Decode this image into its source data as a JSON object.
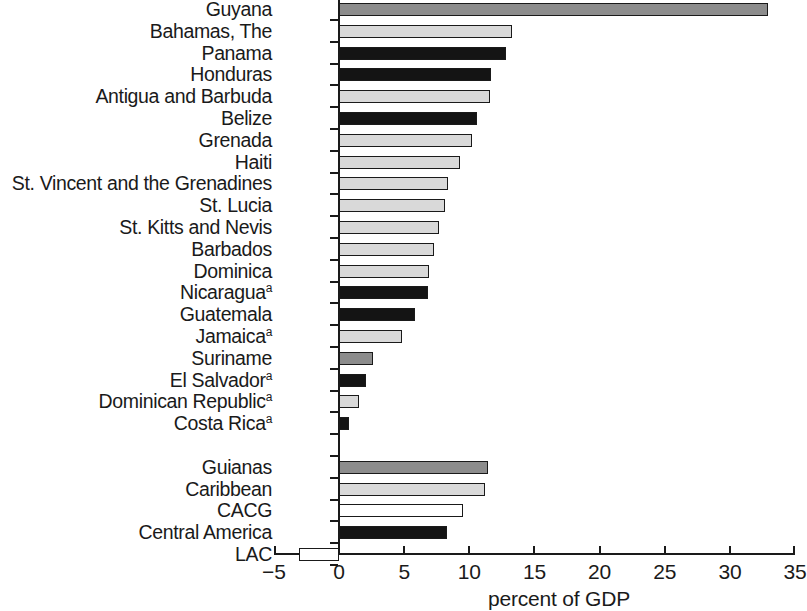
{
  "chart_data": {
    "type": "bar",
    "orientation": "horizontal",
    "title": "",
    "xlabel": "percent of GDP",
    "ylabel": "",
    "xlim": [
      -5,
      35
    ],
    "xticks": [
      -5,
      0,
      5,
      10,
      15,
      20,
      25,
      30,
      35
    ],
    "xtick_labels": [
      "−5",
      "0",
      "5",
      "10",
      "15",
      "20",
      "25",
      "30",
      "35"
    ],
    "grid": false,
    "legend": null,
    "footnote_marker": "a",
    "categories": [
      "Guyana",
      "Bahamas, The",
      "Panama",
      "Honduras",
      "Antigua and Barbuda",
      "Belize",
      "Grenada",
      "Haiti",
      "St. Vincent and the Grenadines",
      "St. Lucia",
      "St. Kitts and Nevis",
      "Barbados",
      "Dominica",
      "Nicaragua",
      "Guatemala",
      "Jamaica",
      "Suriname",
      "El Salvador",
      "Dominican Republic",
      "Costa Rica",
      "Guianas",
      "Caribbean",
      "CACG",
      "Central America",
      "LAC"
    ],
    "values": [
      32.9,
      13.3,
      12.8,
      11.7,
      11.6,
      10.6,
      10.2,
      9.3,
      8.4,
      8.1,
      7.7,
      7.3,
      6.9,
      6.8,
      5.8,
      4.8,
      2.6,
      2.1,
      1.5,
      0.8,
      11.4,
      11.2,
      9.5,
      8.3,
      -3.1
    ],
    "bars": [
      {
        "label": "Guyana",
        "value": 32.9,
        "fill": "#8c8c8c",
        "superscript": "",
        "group": "country"
      },
      {
        "label": "Bahamas, The",
        "value": 13.3,
        "fill": "#d9d9d9",
        "superscript": "",
        "group": "country"
      },
      {
        "label": "Panama",
        "value": 12.8,
        "fill": "#141414",
        "superscript": "",
        "group": "country"
      },
      {
        "label": "Honduras",
        "value": 11.7,
        "fill": "#141414",
        "superscript": "",
        "group": "country"
      },
      {
        "label": "Antigua and Barbuda",
        "value": 11.6,
        "fill": "#d9d9d9",
        "superscript": "",
        "group": "country"
      },
      {
        "label": "Belize",
        "value": 10.6,
        "fill": "#141414",
        "superscript": "",
        "group": "country"
      },
      {
        "label": "Grenada",
        "value": 10.2,
        "fill": "#d9d9d9",
        "superscript": "",
        "group": "country"
      },
      {
        "label": "Haiti",
        "value": 9.3,
        "fill": "#d9d9d9",
        "superscript": "",
        "group": "country"
      },
      {
        "label": "St. Vincent and the Grenadines",
        "value": 8.4,
        "fill": "#d9d9d9",
        "superscript": "",
        "group": "country"
      },
      {
        "label": "St. Lucia",
        "value": 8.1,
        "fill": "#d9d9d9",
        "superscript": "",
        "group": "country"
      },
      {
        "label": "St. Kitts and Nevis",
        "value": 7.7,
        "fill": "#d9d9d9",
        "superscript": "",
        "group": "country"
      },
      {
        "label": "Barbados",
        "value": 7.3,
        "fill": "#d9d9d9",
        "superscript": "",
        "group": "country"
      },
      {
        "label": "Dominica",
        "value": 6.9,
        "fill": "#d9d9d9",
        "superscript": "",
        "group": "country"
      },
      {
        "label": "Nicaragua",
        "value": 6.8,
        "fill": "#141414",
        "superscript": "a",
        "group": "country"
      },
      {
        "label": "Guatemala",
        "value": 5.8,
        "fill": "#141414",
        "superscript": "",
        "group": "country"
      },
      {
        "label": "Jamaica",
        "value": 4.8,
        "fill": "#d9d9d9",
        "superscript": "a",
        "group": "country"
      },
      {
        "label": "Suriname",
        "value": 2.6,
        "fill": "#8c8c8c",
        "superscript": "",
        "group": "country"
      },
      {
        "label": "El Salvador",
        "value": 2.1,
        "fill": "#141414",
        "superscript": "a",
        "group": "country"
      },
      {
        "label": "Dominican Republic",
        "value": 1.5,
        "fill": "#d9d9d9",
        "superscript": "a",
        "group": "country"
      },
      {
        "label": "Costa Rica",
        "value": 0.8,
        "fill": "#141414",
        "superscript": "a",
        "group": "country"
      },
      {
        "label": "Guianas",
        "value": 11.4,
        "fill": "#8c8c8c",
        "superscript": "",
        "group": "aggregate"
      },
      {
        "label": "Caribbean",
        "value": 11.2,
        "fill": "#d9d9d9",
        "superscript": "",
        "group": "aggregate"
      },
      {
        "label": "CACG",
        "value": 9.5,
        "fill": "#ffffff",
        "superscript": "",
        "group": "aggregate"
      },
      {
        "label": "Central America",
        "value": 8.3,
        "fill": "#141414",
        "superscript": "",
        "group": "aggregate"
      },
      {
        "label": "LAC",
        "value": -3.1,
        "fill": "#ffffff",
        "superscript": "",
        "group": "aggregate"
      }
    ]
  }
}
